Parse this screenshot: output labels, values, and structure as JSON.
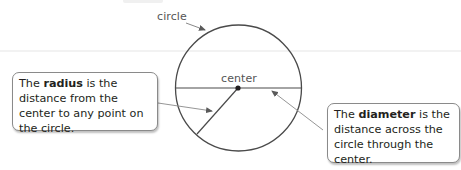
{
  "labels": {
    "circle": "circle",
    "center": "center"
  },
  "callouts": {
    "radius": {
      "prefix": "The ",
      "term": "radius",
      "suffix": " is the distance from the center to any point on the circle."
    },
    "diameter": {
      "prefix": "The ",
      "term": "diameter",
      "suffix": " is the distance across the circle through the center."
    }
  },
  "geometry": {
    "circle": {
      "cx": 238.5,
      "cy": 88,
      "r": 63
    },
    "center_point": {
      "x": 238,
      "y": 88
    },
    "diameter": {
      "x1": 176,
      "y1": 88,
      "x2": 301,
      "y2": 88
    },
    "radius": {
      "x1": 238,
      "y1": 88,
      "x2": 197,
      "y2": 134
    }
  },
  "colors": {
    "stroke": "#4a4a4a",
    "arrow": "#7a7a7a",
    "text": "#231f20",
    "label": "#555555"
  }
}
